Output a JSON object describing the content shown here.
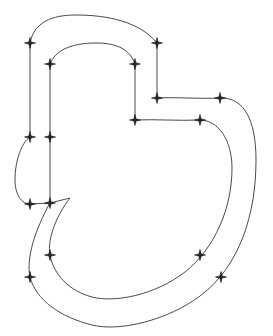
{
  "figure": {
    "title": "",
    "background_color": "#ffffff",
    "width": 273,
    "height": 336
  },
  "style": {
    "curve_stroke_color": "#4a4a4a",
    "curve_stroke_width": 1,
    "marker_color": "#1a1a1a",
    "marker_type": "four-pointed-star",
    "marker_size": 11
  },
  "chart_data": {
    "type": "scatter",
    "title": "",
    "xlabel": "",
    "ylabel": "",
    "xlim": [
      0,
      273
    ],
    "ylim": [
      0,
      336
    ],
    "grid": false,
    "legend": "none",
    "series": [
      {
        "name": "outer-contour",
        "closed": true,
        "path": "M 30 43 C 34 22 52 15 76 15 C 108 15 140 22 157 43 L 157 98 C 175 97 200 99 220 98 C 244 97 256 120 256 160 C 256 214 240 266 200 296 C 168 320 120 332 92 325 C 60 317 36 300 30 277 C 26 258 35 230 50 203 L 30 204 C 22 204 15 195 15 180 C 15 160 22 142 30 137 L 30 43 Z"
      },
      {
        "name": "inner-contour",
        "closed": true,
        "path": "M 50 64 C 55 50 72 43 96 43 C 118 43 130 50 135 64 L 135 120 C 155 119 178 121 200 120 C 218 120 232 140 232 168 C 232 208 215 248 185 272 C 155 295 115 303 92 297 C 70 291 54 276 50 255 C 47 238 57 215 70 198 L 50 203 L 50 64 Z"
      }
    ],
    "markers": [
      {
        "id": "n1",
        "x": 30,
        "y": 43,
        "contour": "outer"
      },
      {
        "id": "n2",
        "x": 157,
        "y": 43,
        "contour": "outer"
      },
      {
        "id": "n3",
        "x": 157,
        "y": 98,
        "contour": "outer"
      },
      {
        "id": "n4",
        "x": 220,
        "y": 98,
        "contour": "outer"
      },
      {
        "id": "n5",
        "x": 221,
        "y": 277,
        "contour": "outer"
      },
      {
        "id": "n6",
        "x": 30,
        "y": 277,
        "contour": "outer"
      },
      {
        "id": "n7",
        "x": 30,
        "y": 204,
        "contour": "outer"
      },
      {
        "id": "n8",
        "x": 30,
        "y": 137,
        "contour": "outer"
      },
      {
        "id": "n9",
        "x": 50,
        "y": 64,
        "contour": "inner"
      },
      {
        "id": "n10",
        "x": 135,
        "y": 64,
        "contour": "inner"
      },
      {
        "id": "n11",
        "x": 135,
        "y": 120,
        "contour": "inner"
      },
      {
        "id": "n12",
        "x": 200,
        "y": 120,
        "contour": "inner"
      },
      {
        "id": "n13",
        "x": 200,
        "y": 255,
        "contour": "inner"
      },
      {
        "id": "n14",
        "x": 50,
        "y": 255,
        "contour": "inner"
      },
      {
        "id": "n15",
        "x": 50,
        "y": 203,
        "contour": "inner"
      },
      {
        "id": "n16",
        "x": 50,
        "y": 137,
        "contour": "inner"
      }
    ]
  }
}
